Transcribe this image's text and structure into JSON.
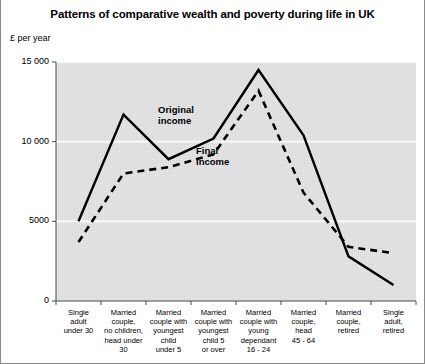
{
  "chart_data": {
    "type": "line",
    "title": "Patterns of comparative wealth and poverty during life in UK",
    "ylabel": "£ per year",
    "xlabel": "",
    "ylim": [
      0,
      15000
    ],
    "yticks": [
      0,
      5000,
      10000,
      15000
    ],
    "ytick_labels": [
      "0",
      "5000",
      "10 000",
      "15 000"
    ],
    "grid": "horizontal white gridlines on grey panel",
    "legend_position": "inline annotations on plot",
    "categories": [
      "Single\nadult\nunder 30",
      "Married\ncouple,\nno children,\nhead under\n30",
      "Married\ncouple with\nyoungest\nchild\nunder 5",
      "Married\ncouple with\nyoungest\nchild 5\nor over",
      "Married\ncouple with\nyoung\ndependant\n16 - 24",
      "Married\ncouple,\nhead\n45 - 64",
      "Married\ncouple,\nretired",
      "Single\nadult,\nretired"
    ],
    "series": [
      {
        "name": "Original income",
        "style": "solid",
        "values": [
          5000,
          11700,
          8900,
          10200,
          14500,
          10400,
          2800,
          1000
        ]
      },
      {
        "name": "Final income",
        "style": "dashed",
        "values": [
          3700,
          8000,
          8400,
          9200,
          13200,
          6800,
          3400,
          3000
        ]
      }
    ],
    "annotations": [
      {
        "text": "Original\nincome",
        "series": "Original income"
      },
      {
        "text": "Final\nincome",
        "series": "Final income"
      }
    ],
    "colors": {
      "panel_background": "#e3e3e3",
      "gridline": "#ffffff",
      "line": "#000000",
      "text": "#000000",
      "border": "#8a8a8a"
    }
  }
}
